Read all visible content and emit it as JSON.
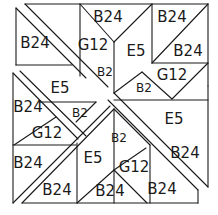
{
  "diagram": {
    "type": "quilt-block-pattern",
    "labels": [
      {
        "id": "l1",
        "text": "B24",
        "x": 108,
        "y": 17,
        "size": "normal"
      },
      {
        "id": "l2",
        "text": "B24",
        "x": 35,
        "y": 43,
        "size": "normal"
      },
      {
        "id": "l3",
        "text": "B24",
        "x": 172,
        "y": 17,
        "size": "normal"
      },
      {
        "id": "l4",
        "text": "G12",
        "x": 93,
        "y": 45,
        "size": "normal"
      },
      {
        "id": "l5",
        "text": "E5",
        "x": 136,
        "y": 51,
        "size": "normal"
      },
      {
        "id": "l6",
        "text": "B24",
        "x": 188,
        "y": 51,
        "size": "normal"
      },
      {
        "id": "l7",
        "text": "B2",
        "x": 105,
        "y": 72,
        "size": "small"
      },
      {
        "id": "l8",
        "text": "G12",
        "x": 172,
        "y": 75,
        "size": "normal"
      },
      {
        "id": "l9",
        "text": "E5",
        "x": 60,
        "y": 88,
        "size": "normal"
      },
      {
        "id": "l10",
        "text": "B2",
        "x": 144,
        "y": 88,
        "size": "small"
      },
      {
        "id": "l11",
        "text": "B24",
        "x": 28,
        "y": 107,
        "size": "normal"
      },
      {
        "id": "l12",
        "text": "B2",
        "x": 80,
        "y": 113,
        "size": "small"
      },
      {
        "id": "l13",
        "text": "E5",
        "x": 174,
        "y": 119,
        "size": "normal"
      },
      {
        "id": "l14",
        "text": "G12",
        "x": 47,
        "y": 133,
        "size": "normal"
      },
      {
        "id": "l15",
        "text": "B2",
        "x": 119,
        "y": 138,
        "size": "small"
      },
      {
        "id": "l16",
        "text": "B24",
        "x": 185,
        "y": 153,
        "size": "normal"
      },
      {
        "id": "l17",
        "text": "G12",
        "x": 134,
        "y": 167,
        "size": "normal"
      },
      {
        "id": "l18",
        "text": "E5",
        "x": 93,
        "y": 158,
        "size": "normal"
      },
      {
        "id": "l19",
        "text": "B24",
        "x": 28,
        "y": 163,
        "size": "normal"
      },
      {
        "id": "l20",
        "text": "B24",
        "x": 162,
        "y": 189,
        "size": "normal"
      },
      {
        "id": "l21",
        "text": "B24",
        "x": 110,
        "y": 191,
        "size": "normal"
      },
      {
        "id": "l22",
        "text": "B24",
        "x": 57,
        "y": 190,
        "size": "normal"
      }
    ],
    "line_color": "#1a1a1a",
    "background": "#ffffff"
  }
}
